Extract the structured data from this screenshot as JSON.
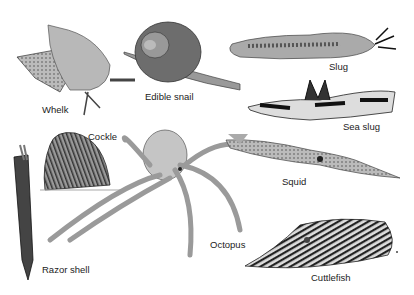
{
  "plate": {
    "background": "#ffffff",
    "specimens": [
      {
        "id": "whelk",
        "label": "Whelk",
        "x": 42,
        "y": 104
      },
      {
        "id": "edible-snail",
        "label": "Edible snail",
        "x": 145,
        "y": 91
      },
      {
        "id": "slug",
        "label": "Slug",
        "x": 329,
        "y": 61
      },
      {
        "id": "sea-slug",
        "label": "Sea slug",
        "x": 343,
        "y": 121
      },
      {
        "id": "cockle",
        "label": "Cockle",
        "x": 88,
        "y": 131
      },
      {
        "id": "squid",
        "label": "Squid",
        "x": 282,
        "y": 176
      },
      {
        "id": "octopus",
        "label": "Octopus",
        "x": 210,
        "y": 239
      },
      {
        "id": "razor-shell",
        "label": "Razor shell",
        "x": 42,
        "y": 264
      },
      {
        "id": "cuttlefish",
        "label": "Cuttlefish",
        "x": 311,
        "y": 272
      }
    ]
  }
}
